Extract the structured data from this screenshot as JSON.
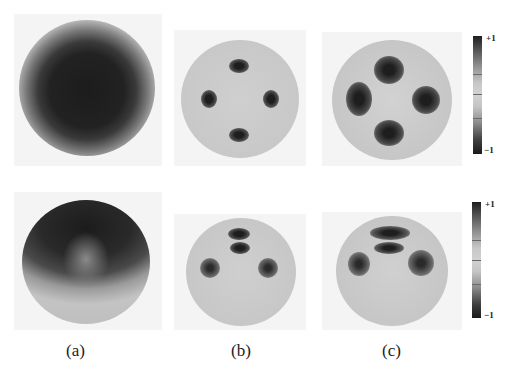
{
  "figure": {
    "rows": [
      {
        "panels": [
          {
            "id": "a",
            "description": "sphere with large dark central region and light rim"
          },
          {
            "id": "b",
            "description": "light sphere with four small dark spots in cross arrangement"
          },
          {
            "id": "c",
            "description": "light sphere with four larger dark lobes"
          }
        ],
        "colorbar": {
          "max_label": "+1",
          "min_label": "−1"
        }
      },
      {
        "panels": [
          {
            "id": "a",
            "description": "sphere with dark upper cap and light lower band"
          },
          {
            "id": "b",
            "description": "sphere with stacked dark spots at top and two side spots"
          },
          {
            "id": "c",
            "description": "sphere with elongated dark lobes at top and two side lobes"
          }
        ],
        "colorbar": {
          "max_label": "+1",
          "min_label": "−1"
        }
      }
    ],
    "column_labels": [
      "(a)",
      "(b)",
      "(c)"
    ]
  },
  "colors": {
    "background": "#ffffff",
    "panel_bg": "#f4f4f4",
    "sphere_light": "#c9c9c9",
    "dark": "#1e1e1e"
  }
}
